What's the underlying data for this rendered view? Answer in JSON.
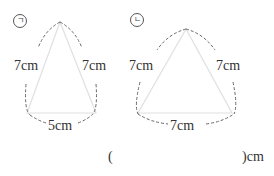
{
  "figures": [
    {
      "marker": "㉠",
      "marker_glyph": "ㄱ",
      "sides": {
        "left": "7cm",
        "right": "7cm",
        "base": "5cm"
      }
    },
    {
      "marker": "㉡",
      "marker_glyph": "ㄴ",
      "sides": {
        "left": "7cm",
        "right": "7cm",
        "base": "7cm"
      }
    }
  ],
  "answer": {
    "open_paren": "(",
    "close_paren_unit": ")cm",
    "value": ""
  },
  "colors": {
    "triangle_line": "#e0e0e0",
    "dashed_arc": "#666666",
    "text": "#333333"
  }
}
